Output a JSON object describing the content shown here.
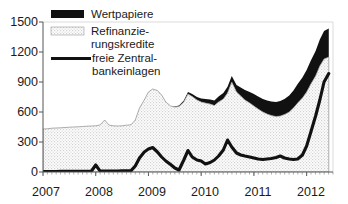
{
  "chart_data": {
    "type": "area",
    "title": "",
    "subtitle": "",
    "xlabel": "",
    "ylabel": "",
    "ylim": [
      0,
      1500
    ],
    "yticks": [
      0,
      300,
      600,
      900,
      1200,
      1500
    ],
    "ytick_labels": [
      "0",
      "300",
      "600",
      "900",
      "1200",
      "1500"
    ],
    "xlim": [
      2007.0,
      2012.5
    ],
    "xticks": [
      2007,
      2008,
      2009,
      2010,
      2011,
      2012
    ],
    "xtick_labels": [
      "2007",
      "2008",
      "2009",
      "2010",
      "2011",
      "2012"
    ],
    "grid": false,
    "minor_ticks": "monthly",
    "legend_position": "top-left",
    "stacking": "Refinanzierungskredite then Wertpapiere stacked on top",
    "legend": [
      {
        "label": "Wertpapiere",
        "marker": "black-filled-rect",
        "color": "#111111"
      },
      {
        "label": "Refinanzie-\nrungskredite",
        "marker": "stippled-gray-rect",
        "color": "#e8e8e8"
      },
      {
        "label": "freie Zentral-\nbankeinlagen",
        "marker": "thick-black-line",
        "color": "#111111"
      }
    ],
    "x": [
      2007.0,
      2007.08,
      2007.17,
      2007.25,
      2007.33,
      2007.42,
      2007.5,
      2007.58,
      2007.67,
      2007.75,
      2007.83,
      2007.92,
      2008.0,
      2008.08,
      2008.17,
      2008.25,
      2008.33,
      2008.42,
      2008.5,
      2008.58,
      2008.67,
      2008.75,
      2008.83,
      2008.92,
      2009.0,
      2009.08,
      2009.17,
      2009.25,
      2009.33,
      2009.42,
      2009.5,
      2009.58,
      2009.67,
      2009.75,
      2009.83,
      2009.92,
      2010.0,
      2010.08,
      2010.17,
      2010.25,
      2010.33,
      2010.42,
      2010.5,
      2010.58,
      2010.67,
      2010.75,
      2010.83,
      2010.92,
      2011.0,
      2011.08,
      2011.17,
      2011.25,
      2011.33,
      2011.42,
      2011.5,
      2011.58,
      2011.67,
      2011.75,
      2011.83,
      2011.92,
      2012.0,
      2012.08,
      2012.17,
      2012.25,
      2012.33,
      2012.42
    ],
    "series": [
      {
        "name": "Refinanzierungskredite",
        "fill": "stipple",
        "values": [
          430,
          432,
          438,
          440,
          442,
          445,
          448,
          450,
          452,
          455,
          458,
          460,
          462,
          470,
          520,
          470,
          462,
          460,
          462,
          468,
          472,
          520,
          640,
          720,
          800,
          830,
          815,
          770,
          700,
          660,
          650,
          655,
          700,
          780,
          755,
          720,
          700,
          690,
          680,
          665,
          700,
          730,
          790,
          900,
          800,
          760,
          720,
          690,
          660,
          630,
          600,
          580,
          565,
          555,
          560,
          575,
          600,
          640,
          690,
          740,
          800,
          880,
          960,
          1060,
          1130,
          1150
        ]
      },
      {
        "name": "Wertpapiere",
        "fill": "black",
        "values": [
          0,
          0,
          0,
          0,
          0,
          0,
          0,
          0,
          0,
          0,
          0,
          0,
          0,
          0,
          0,
          0,
          0,
          0,
          0,
          0,
          0,
          0,
          0,
          0,
          0,
          0,
          0,
          0,
          0,
          0,
          5,
          10,
          15,
          20,
          25,
          30,
          35,
          40,
          45,
          50,
          55,
          60,
          62,
          60,
          70,
          85,
          100,
          110,
          120,
          125,
          130,
          135,
          140,
          145,
          150,
          155,
          165,
          175,
          190,
          205,
          220,
          235,
          250,
          265,
          280,
          285
        ]
      },
      {
        "name": "freie Zentralbankeinlagen",
        "fill": "line",
        "values": [
          5,
          5,
          5,
          5,
          6,
          6,
          6,
          7,
          7,
          8,
          8,
          10,
          70,
          12,
          10,
          10,
          10,
          10,
          12,
          12,
          14,
          60,
          140,
          200,
          230,
          245,
          200,
          150,
          110,
          75,
          40,
          20,
          120,
          215,
          150,
          120,
          110,
          80,
          95,
          120,
          160,
          220,
          320,
          250,
          190,
          170,
          160,
          150,
          140,
          130,
          125,
          130,
          135,
          145,
          160,
          140,
          130,
          125,
          130,
          170,
          260,
          400,
          560,
          720,
          900,
          985
        ]
      }
    ]
  },
  "axis": {
    "ytick_labels": [
      "1500",
      "1200",
      "900",
      "600",
      "300",
      "0"
    ],
    "xtick_labels": [
      "2007",
      "2008",
      "2009",
      "2010",
      "2011",
      "2012"
    ]
  },
  "legend": {
    "items": [
      {
        "label": "Wertpapiere",
        "line2": ""
      },
      {
        "label": "Refinanzie-",
        "line2": "rungskredite"
      },
      {
        "label": "freie Zentral-",
        "line2": "bankeinlagen"
      }
    ]
  }
}
